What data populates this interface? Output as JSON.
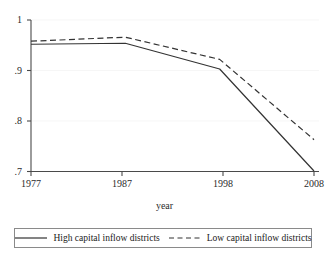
{
  "chart_data": {
    "type": "line",
    "title": "",
    "xlabel": "year",
    "ylabel": "",
    "x": [
      1977,
      1987,
      1998,
      2008
    ],
    "xticks": [
      "1977",
      "1987",
      "1998",
      "2008"
    ],
    "yticks": [
      "1",
      ".9",
      ".8",
      ".7"
    ],
    "ytick_values": [
      1,
      0.9,
      0.8,
      0.7
    ],
    "ylim": [
      0.7,
      1.0
    ],
    "xlim": [
      1977,
      2008
    ],
    "grid": false,
    "legend_position": "below",
    "series": [
      {
        "name": "High capital inflow districts",
        "style": "solid",
        "color": "#333333",
        "values": [
          0.952,
          0.954,
          0.903,
          0.701
        ]
      },
      {
        "name": "Low capital inflow districts",
        "style": "dashed",
        "color": "#333333",
        "values": [
          0.958,
          0.966,
          0.922,
          0.763
        ]
      }
    ]
  },
  "axis": {
    "x_title": "year",
    "y_tick_1": "1",
    "y_tick_2": ".9",
    "y_tick_3": ".8",
    "y_tick_4": ".7",
    "x_tick_1": "1977",
    "x_tick_2": "1987",
    "x_tick_3": "1998",
    "x_tick_4": "2008"
  },
  "legend": {
    "entries": [
      {
        "label": "High capital inflow districts",
        "style": "solid"
      },
      {
        "label": "Low capital inflow districts",
        "style": "dashed"
      }
    ]
  },
  "colors": {
    "line": "#333333",
    "axis": "#4a4a4a",
    "text": "#1a1a1a",
    "background": "#ffffff",
    "legend_border": "#8a8a8a"
  }
}
